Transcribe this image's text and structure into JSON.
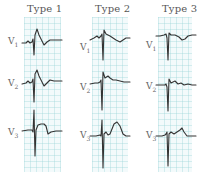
{
  "figure": {
    "columns": [
      {
        "label": "Type 1",
        "leads": [
          {
            "name": "V",
            "sub": "1"
          },
          {
            "name": "V",
            "sub": "2"
          },
          {
            "name": "V",
            "sub": "3"
          }
        ]
      },
      {
        "label": "Type 2",
        "leads": [
          {
            "name": "V",
            "sub": "1"
          },
          {
            "name": "V",
            "sub": "2"
          },
          {
            "name": "V",
            "sub": "3"
          }
        ]
      },
      {
        "label": "Type 3",
        "leads": [
          {
            "name": "V",
            "sub": "1"
          },
          {
            "name": "V",
            "sub": "2"
          },
          {
            "name": "V",
            "sub": "3"
          }
        ]
      }
    ],
    "colors": {
      "grid_background": "#f3fafb",
      "grid_lines": "#96d2d7",
      "trace": "#333333",
      "text": "#555555"
    }
  }
}
